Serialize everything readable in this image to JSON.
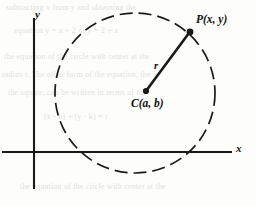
{
  "figure": {
    "type": "geometry-diagram",
    "axes": {
      "x_label": "x",
      "y_label": "x_placeholder_unused",
      "y_axis_label": "y",
      "origin": {
        "x": 34,
        "y": 152
      },
      "x_start": 2,
      "x_end": 232,
      "y_top": 18,
      "y_bottom": 189
    },
    "circle": {
      "center": {
        "x": 135,
        "y": 93
      },
      "radius": 80,
      "stroke": "#1a1a1a",
      "dashed": true
    },
    "center_point": {
      "x": 146,
      "y": 91
    },
    "point_p": {
      "x": 190,
      "y": 33
    },
    "labels": {
      "point_p": "P(x, y)",
      "center": "C(a, b)",
      "radius": "r",
      "x_axis": "x",
      "y_axis": "y"
    },
    "colors": {
      "ink": "#1a1a1a",
      "paper": "#fdfdfc",
      "ghost_text": "#9a9a96"
    }
  },
  "ghost_text": {
    "note": "faint illegible show-through text from reverse side of printed page",
    "lines": [
      "subtracting  x  from  y  and  obtaining  the",
      "equation  y = x + 2  or  y = 2 + x",
      "the equation of the circle with center at the",
      "radius  r.  The other form of the equation, the",
      "the  square,  can  be  written  in  terms  of  the",
      "(x - h)  +  (y - k)  =  r"
    ]
  }
}
